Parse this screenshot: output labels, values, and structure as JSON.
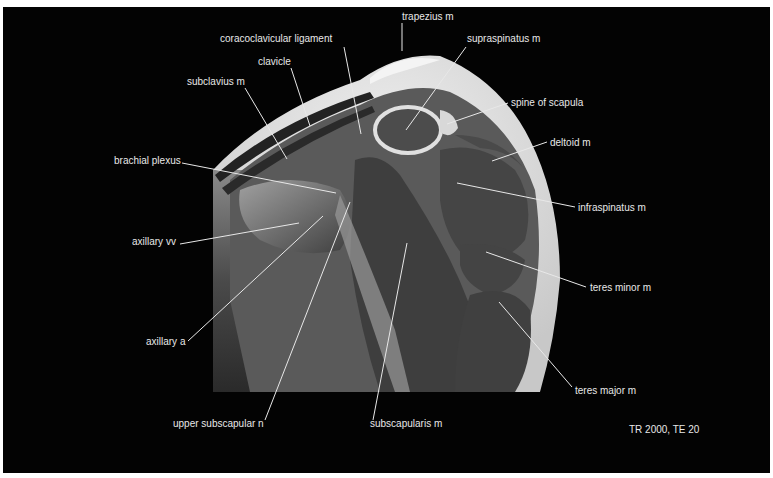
{
  "figure": {
    "type": "MRI coronal oblique section of shoulder (labeled anatomy)",
    "sequence_info": "TR 2000, TE 20",
    "background_color": "#030303",
    "label_color": "#e8e8e8"
  },
  "labels": [
    {
      "id": "trapezius",
      "text": "trapezius m",
      "x": 402,
      "y": 11,
      "line": [
        [
          402,
          23
        ],
        [
          402,
          51
        ]
      ]
    },
    {
      "id": "coracoclavicular",
      "text": "coracoclavicular ligament",
      "x": 220,
      "y": 33,
      "line": [
        [
          344,
          47
        ],
        [
          361,
          134
        ]
      ]
    },
    {
      "id": "supraspinatus",
      "text": "supraspinatus m",
      "x": 467,
      "y": 33,
      "line": [
        [
          466,
          47
        ],
        [
          406,
          130
        ]
      ]
    },
    {
      "id": "clavicle",
      "text": "clavicle",
      "x": 258,
      "y": 56,
      "line": [
        [
          291,
          68
        ],
        [
          310,
          126
        ]
      ]
    },
    {
      "id": "spine_scapula",
      "text": "spine of scapula",
      "x": 511,
      "y": 97,
      "line": [
        [
          508,
          103
        ],
        [
          447,
          124
        ]
      ]
    },
    {
      "id": "subclavius",
      "text": "subclavius m",
      "x": 187,
      "y": 76,
      "line": [
        [
          245,
          88
        ],
        [
          287,
          159
        ]
      ]
    },
    {
      "id": "deltoid",
      "text": "deltoid m",
      "x": 550,
      "y": 137,
      "line": [
        [
          547,
          142
        ],
        [
          492,
          161
        ]
      ]
    },
    {
      "id": "brachial_plexus",
      "text": "brachial plexus",
      "x": 114,
      "y": 155,
      "line": [
        [
          182,
          163
        ],
        [
          336,
          193
        ]
      ]
    },
    {
      "id": "infraspinatus",
      "text": "infraspinatus m",
      "x": 578,
      "y": 202,
      "line": [
        [
          575,
          207
        ],
        [
          457,
          183
        ]
      ]
    },
    {
      "id": "axillary_vv",
      "text": "axillary vv",
      "x": 132,
      "y": 236,
      "line": [
        [
          180,
          244
        ],
        [
          299,
          223
        ]
      ]
    },
    {
      "id": "teres_minor",
      "text": "teres minor m",
      "x": 590,
      "y": 282,
      "line": [
        [
          586,
          287
        ],
        [
          486,
          252
        ]
      ]
    },
    {
      "id": "axillary_a",
      "text": "axillary a",
      "x": 146,
      "y": 336,
      "line": [
        [
          188,
          341
        ],
        [
          323,
          216
        ]
      ]
    },
    {
      "id": "teres_major",
      "text": "teres major m",
      "x": 575,
      "y": 385,
      "line": [
        [
          572,
          387
        ],
        [
          499,
          302
        ]
      ]
    },
    {
      "id": "upper_subscapular",
      "text": "upper subscapular n",
      "x": 173,
      "y": 418,
      "line": [
        [
          265,
          420
        ],
        [
          350,
          202
        ]
      ]
    },
    {
      "id": "subscapularis",
      "text": "subscapularis m",
      "x": 370,
      "y": 418,
      "line": [
        [
          373,
          420
        ],
        [
          407,
          243
        ]
      ]
    },
    {
      "id": "tr_te",
      "text": "TR 2000, TE 20",
      "x": 629,
      "y": 424,
      "line": null
    }
  ]
}
